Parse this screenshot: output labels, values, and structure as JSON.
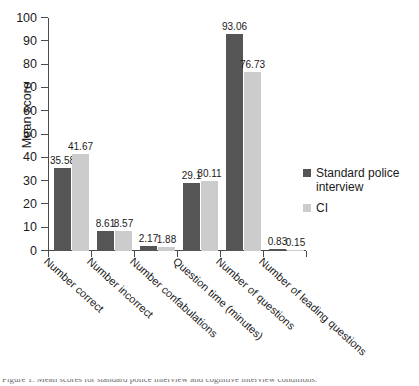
{
  "chart_data": {
    "type": "bar",
    "title": "",
    "xlabel": "",
    "ylabel": "Mean score",
    "ylim": [
      0,
      100
    ],
    "ytick_step": 10,
    "yticks": [
      0,
      10,
      20,
      30,
      40,
      50,
      60,
      70,
      80,
      90,
      100
    ],
    "grid": false,
    "legend_position": "right",
    "categories": [
      "Number correct",
      "Number incorrect",
      "Number confabulations",
      "Question time (minutes)",
      "Number of questions",
      "Number of leading questions"
    ],
    "series": [
      {
        "name": "Standard police interview",
        "color": "#555555",
        "values": [
          35.58,
          8.61,
          2.17,
          29.1,
          93.06,
          0.83
        ],
        "labels": [
          "35.58",
          "8.61",
          "2.17",
          "29.1",
          "93.06",
          "0.83"
        ]
      },
      {
        "name": "CI",
        "color": "#cccccc",
        "values": [
          41.67,
          8.57,
          1.88,
          30.11,
          76.73,
          0.15
        ],
        "labels": [
          "41.67",
          "8.57",
          "1.88",
          "30.11",
          "76.73",
          "0.15"
        ]
      }
    ]
  },
  "legend": {
    "entries": [
      {
        "label": "Standard police interview"
      },
      {
        "label": "CI"
      }
    ]
  },
  "caption": {
    "text": "Figure 1. Mean scores for standard police interview and cognitive interview conditions."
  },
  "colors": {
    "series_dark": "#555555",
    "series_light": "#cccccc",
    "axis": "#4a4a4a",
    "text": "#1a1a1a",
    "background": "#ffffff"
  }
}
